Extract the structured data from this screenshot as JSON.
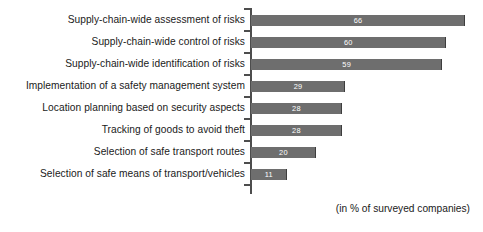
{
  "chart_data": {
    "type": "bar",
    "orientation": "horizontal",
    "title": "",
    "subtitle": "",
    "xlabel": "",
    "ylabel": "",
    "footnote": "(in % of surveyed companies)",
    "value_unit": "%",
    "grid": false,
    "legend": false,
    "xlim": [
      0,
      66
    ],
    "axis_line": "vertical-left-with-ticks",
    "bar_color": "#6e6e6e",
    "value_label_color": "#ffffff",
    "categories": [
      "Supply-chain-wide assessment of risks",
      "Supply-chain-wide control of risks",
      "Supply-chain-wide identification of risks",
      "Implementation of a safety management system",
      "Location planning based on security aspects",
      "Tracking of goods to avoid theft",
      "Selection of safe transport routes",
      "Selection of safe means of transport/vehicles"
    ],
    "values": [
      66,
      60,
      59,
      29,
      28,
      28,
      20,
      11
    ],
    "value_labels": [
      "66",
      "60",
      "59",
      "29",
      "28",
      "28",
      "20",
      "11"
    ]
  }
}
